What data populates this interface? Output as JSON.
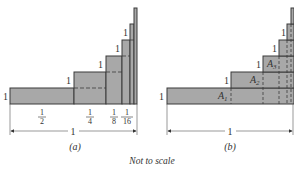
{
  "figure": {
    "caption": "Not to scale",
    "colors": {
      "fill": "#a8a8a8",
      "stroke": "#3a3a3a",
      "text": "#333333"
    },
    "panel_a": {
      "label": "(a)",
      "heights": [
        "1",
        "1",
        "1",
        "1",
        "1"
      ],
      "widths": [
        {
          "num": "1",
          "den": "2"
        },
        {
          "num": "1",
          "den": "4"
        },
        {
          "num": "1",
          "den": "8"
        },
        {
          "num": "1",
          "den": "16"
        }
      ],
      "total_width_label": "1"
    },
    "panel_b": {
      "label": "(b)",
      "heights": [
        "1",
        "1",
        "1",
        "1",
        "1"
      ],
      "areas": [
        {
          "name": "A",
          "sub": "1"
        },
        {
          "name": "A",
          "sub": "2"
        },
        {
          "name": "A",
          "sub": "3"
        }
      ],
      "total_width_label": "1"
    }
  }
}
